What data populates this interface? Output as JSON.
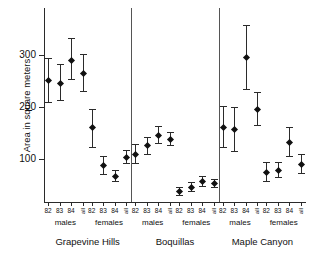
{
  "chart_data": {
    "type": "scatter",
    "title": "",
    "xlabel": "",
    "ylabel": "Area in square meters",
    "ylim": [
      0,
      360
    ],
    "yticks": [
      100,
      200,
      300
    ],
    "ytick_labels": [
      "100",
      "200",
      "300"
    ],
    "grid": false,
    "legend": "none",
    "error_bars": "vertical, capped",
    "marker": "filled diamond",
    "panels": [
      {
        "label": "Grapevine Hills",
        "groups": [
          {
            "label": "males",
            "categories": [
              "82",
              "83",
              "84",
              "all"
            ],
            "values": [
              252,
              247,
              291,
              266
            ],
            "lower": [
              210,
              214,
              254,
              231
            ],
            "upper": [
              295,
              283,
              332,
              302
            ]
          },
          {
            "label": "females",
            "categories": [
              "82",
              "83",
              "84",
              "all"
            ],
            "values": [
              161,
              88,
              67,
              104
            ],
            "lower": [
              124,
              72,
              57,
              92
            ],
            "upper": [
              196,
              105,
              79,
              117
            ]
          }
        ]
      },
      {
        "label": "Boquillas",
        "groups": [
          {
            "label": "males",
            "categories": [
              "82",
              "83",
              "84",
              "all"
            ],
            "values": [
              110,
              126,
              147,
              139
            ],
            "lower": [
              93,
              110,
              131,
              127
            ],
            "upper": [
              128,
              142,
              163,
              151
            ]
          },
          {
            "label": "females",
            "categories": [
              "82",
              "83",
              "84",
              "all"
            ],
            "values": [
              38,
              47,
              57,
              54
            ],
            "lower": [
              30,
              39,
              48,
              47
            ],
            "upper": [
              47,
              56,
              67,
              62
            ]
          }
        ]
      },
      {
        "label": "Maple Canyon",
        "groups": [
          {
            "label": "males",
            "categories": [
              "82",
              "83",
              "84",
              "all"
            ],
            "values": [
              162,
              157,
              297,
              196
            ],
            "lower": [
              124,
              115,
              235,
              166
            ],
            "upper": [
              201,
              200,
              358,
              228
            ]
          },
          {
            "label": "females",
            "categories": [
              "82",
              "83",
              "84",
              "all"
            ],
            "values": [
              75,
              79,
              133,
              91
            ],
            "lower": [
              57,
              65,
              106,
              74
            ],
            "upper": [
              95,
              94,
              162,
              110
            ]
          }
        ]
      }
    ]
  }
}
